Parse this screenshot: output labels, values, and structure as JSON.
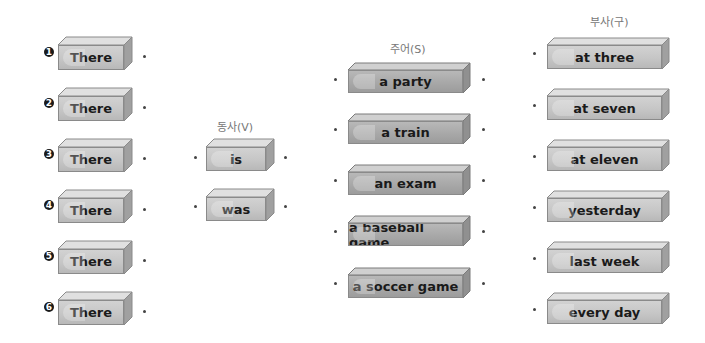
{
  "headings": {
    "verb": "동사(V)",
    "subject": "주어(S)",
    "adverb": "부사(구)"
  },
  "column_there": {
    "numbers": [
      "1",
      "2",
      "3",
      "4",
      "5",
      "6"
    ],
    "items": [
      "There",
      "There",
      "There",
      "There",
      "There",
      "There"
    ]
  },
  "column_verb": {
    "items": [
      "is",
      "was"
    ]
  },
  "column_subject": {
    "items": [
      "a party",
      "a train",
      "an exam",
      "a baseball game",
      "a soccer game"
    ]
  },
  "column_adverb": {
    "items": [
      "at three",
      "at seven",
      "at eleven",
      "yesterday",
      "last week",
      "every day"
    ]
  },
  "colors": {
    "block_face": "#c6c6c6",
    "block_face_dark": "#a8a8a8",
    "block_border": "#8a8a8a",
    "heading_text": "#777777"
  }
}
